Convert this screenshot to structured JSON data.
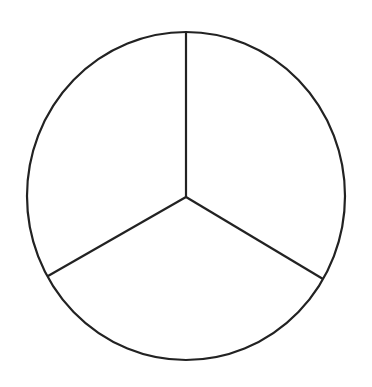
{
  "diagram": {
    "type": "circle-divided-into-three-sectors",
    "sectors": 3,
    "stroke_color": "#222222",
    "background": "#ffffff",
    "labels": []
  }
}
